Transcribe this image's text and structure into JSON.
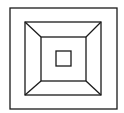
{
  "diagram": {
    "stroke_color": "#1a1a1a",
    "background": "#ffffff",
    "outer_square": {
      "x": 10,
      "y": 8,
      "w": 107,
      "h": 101
    },
    "middle_square": {
      "x": 25,
      "y": 22,
      "w": 76,
      "h": 73
    },
    "inner_square": {
      "x": 41,
      "y": 37,
      "w": 45,
      "h": 44
    },
    "center_square": {
      "x": 56,
      "y": 51,
      "w": 15,
      "h": 15
    }
  }
}
